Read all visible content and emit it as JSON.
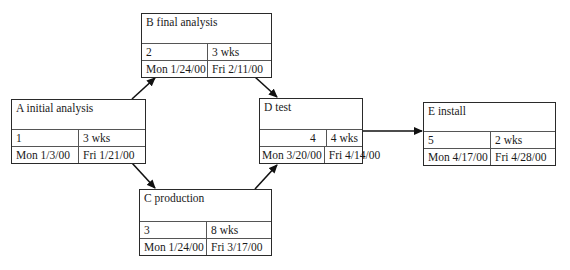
{
  "diagram": {
    "type": "network-pert",
    "nodes": [
      {
        "id": "A",
        "title": "A initial analysis",
        "number": "1",
        "duration": "3 wks",
        "start": "Mon 1/3/00",
        "finish": "Fri 1/21/00"
      },
      {
        "id": "B",
        "title": "B final analysis",
        "number": "2",
        "duration": "3 wks",
        "start": "Mon 1/24/00",
        "finish": "Fri 2/11/00"
      },
      {
        "id": "C",
        "title": "C production",
        "number": "3",
        "duration": "8 wks",
        "start": "Mon 1/24/00",
        "finish": "Fri 3/17/00"
      },
      {
        "id": "D",
        "title": "D test",
        "number": "4",
        "duration": "4 wks",
        "start": "Mon 3/20/00",
        "finish": "Fri 4/14/00"
      },
      {
        "id": "E",
        "title": "E install",
        "number": "5",
        "duration": "2 wks",
        "start": "Mon 4/17/00",
        "finish": "Fri 4/28/00"
      }
    ],
    "edges": [
      {
        "from": "A",
        "to": "B"
      },
      {
        "from": "A",
        "to": "C"
      },
      {
        "from": "B",
        "to": "D"
      },
      {
        "from": "C",
        "to": "D"
      },
      {
        "from": "D",
        "to": "E"
      }
    ]
  }
}
